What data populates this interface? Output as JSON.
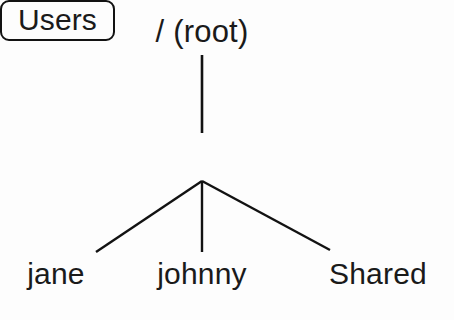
{
  "diagram": {
    "background_color": "#fdfdfd",
    "stroke_color": "#121212",
    "text_color": "#1a1a1a",
    "root": {
      "label": "/ (root)",
      "shape": "none"
    },
    "users": {
      "label": "Users",
      "shape": "rounded-rectangle"
    },
    "leaves": [
      {
        "label": "jane"
      },
      {
        "label": "johnny"
      },
      {
        "label": "Shared"
      }
    ],
    "edges": [
      {
        "from": "root",
        "to": "Users",
        "kind": "vertical"
      },
      {
        "from": "Users",
        "to": "jane",
        "kind": "diagonal-left"
      },
      {
        "from": "Users",
        "to": "johnny",
        "kind": "vertical"
      },
      {
        "from": "Users",
        "to": "Shared",
        "kind": "diagonal-right"
      }
    ]
  }
}
